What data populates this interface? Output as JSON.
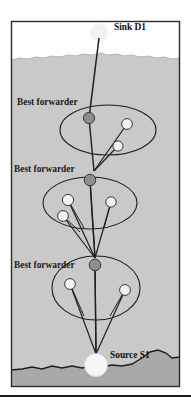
{
  "figure": {
    "kind": "underwater-sensor-network-routing-diagram",
    "labels": {
      "sink": "Sink D1",
      "source": "Source S1",
      "forwarder_1": "Best forwarder",
      "forwarder_2": "Best forwarder",
      "forwarder_3": "Best forwarder"
    },
    "colors": {
      "water": "#c9c9c9",
      "seabed": "#a9a9a9",
      "sky": "#ffffff",
      "frame": "#2b2b2b",
      "line": "#1e1e1e",
      "forwarder_node": "#8e8e8e",
      "candidate_node": "#f2f2f2",
      "source_node": "#f7f7f7",
      "sink_node": "#ededed",
      "rule": "#1a1a1a"
    },
    "nodes": [
      {
        "id": "sink-d1",
        "role": "sink",
        "cx": 99,
        "cy": 33,
        "r": 9.5,
        "fill": "sink_node"
      },
      {
        "id": "fwd-1",
        "role": "best-forwarder",
        "cx": 89,
        "cy": 118,
        "r": 5.6,
        "fill": "forwarder_node"
      },
      {
        "id": "cand-1a",
        "role": "candidate",
        "cx": 127,
        "cy": 124,
        "r": 5.4,
        "fill": "candidate_node"
      },
      {
        "id": "cand-1b",
        "role": "candidate",
        "cx": 118,
        "cy": 146,
        "r": 5.1,
        "fill": "candidate_node"
      },
      {
        "id": "fwd-2",
        "role": "best-forwarder",
        "cx": 90,
        "cy": 180,
        "r": 5.8,
        "fill": "forwarder_node"
      },
      {
        "id": "cand-2a",
        "role": "candidate",
        "cx": 68,
        "cy": 200,
        "r": 5.6,
        "fill": "candidate_node"
      },
      {
        "id": "cand-2b",
        "role": "candidate",
        "cx": 63,
        "cy": 216,
        "r": 5.4,
        "fill": "candidate_node"
      },
      {
        "id": "cand-2c",
        "role": "candidate",
        "cx": 111,
        "cy": 202,
        "r": 5.2,
        "fill": "candidate_node"
      },
      {
        "id": "fwd-3",
        "role": "best-forwarder",
        "cx": 95,
        "cy": 265,
        "r": 5.8,
        "fill": "forwarder_node"
      },
      {
        "id": "cand-3a",
        "role": "candidate",
        "cx": 70,
        "cy": 284,
        "r": 5.4,
        "fill": "candidate_node"
      },
      {
        "id": "cand-3b",
        "role": "candidate",
        "cx": 125,
        "cy": 290,
        "r": 5.4,
        "fill": "candidate_node"
      },
      {
        "id": "source-s1",
        "role": "source",
        "cx": 96,
        "cy": 365,
        "r": 11.5,
        "fill": "source_node"
      }
    ],
    "clusters": [
      {
        "id": "cluster-1",
        "cx": 108,
        "cy": 130,
        "rx": 48,
        "ry": 25
      },
      {
        "id": "cluster-2",
        "cx": 90,
        "cy": 203,
        "rx": 47,
        "ry": 26
      },
      {
        "id": "cluster-3",
        "cx": 96,
        "cy": 288,
        "rx": 44,
        "ry": 32
      }
    ],
    "water_surface_y": 57,
    "seabed_y": 367,
    "frame": {
      "x": 11,
      "y": 21,
      "w": 169,
      "h": 366
    },
    "rule_y": 396
  }
}
